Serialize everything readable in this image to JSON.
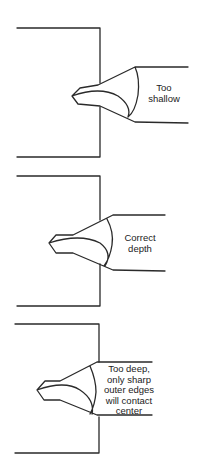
{
  "diagram": {
    "panels": [
      {
        "id": "too-shallow",
        "label_lines": [
          "Too",
          "shallow"
        ]
      },
      {
        "id": "correct-depth",
        "label_lines": [
          "Correct",
          "depth"
        ]
      },
      {
        "id": "too-deep",
        "label_lines": [
          "Too deep,",
          "only sharp",
          "outer edges",
          "will contact",
          "center"
        ]
      }
    ],
    "colors": {
      "line": "#2a2a2a",
      "background": "#ffffff",
      "text": "#222222"
    }
  }
}
